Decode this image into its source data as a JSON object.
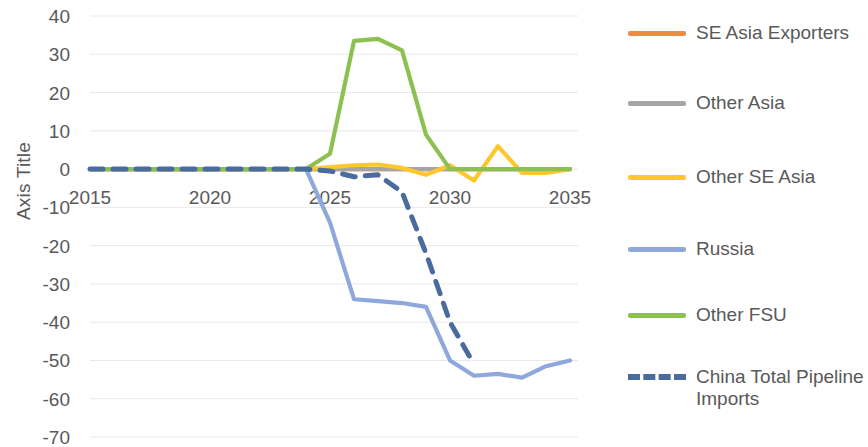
{
  "chart_data": {
    "type": "line",
    "title": "",
    "subtitle": "",
    "xlabel": "",
    "ylabel": "Axis Title",
    "xlim": [
      2015,
      2035
    ],
    "ylim": [
      -70,
      40
    ],
    "ytick_step": 10,
    "grid": true,
    "grid_axis": "y",
    "legend_position": "right",
    "x": [
      2015,
      2016,
      2017,
      2018,
      2019,
      2020,
      2021,
      2022,
      2023,
      2024,
      2025,
      2026,
      2027,
      2028,
      2029,
      2030,
      2031,
      2032,
      2033,
      2034,
      2035
    ],
    "xtick_labels": [
      "2015",
      "2020",
      "2025",
      "2030",
      "2035"
    ],
    "xticks": [
      2015,
      2020,
      2025,
      2030,
      2035
    ],
    "ytick_labels": [
      "40",
      "30",
      "20",
      "10",
      "0",
      "-10",
      "-20",
      "-30",
      "-40",
      "-50",
      "-60",
      "-70"
    ],
    "yticks": [
      40,
      30,
      20,
      10,
      0,
      -10,
      -20,
      -30,
      -40,
      -50,
      -60,
      -70
    ],
    "series": [
      {
        "name": "SE Asia Exporters",
        "color": "#ED8B45",
        "style": "solid",
        "values": [
          0,
          0,
          0,
          0,
          0,
          0,
          0,
          0,
          0,
          0,
          0,
          0,
          0,
          0,
          0,
          0,
          0,
          0,
          0,
          0,
          0
        ]
      },
      {
        "name": "Other Asia",
        "color": "#A5A5A5",
        "style": "solid",
        "values": [
          0,
          0,
          0,
          0,
          0,
          0,
          0,
          0,
          0,
          0,
          0,
          0,
          0,
          0,
          0,
          0,
          0,
          0,
          0,
          0,
          0
        ]
      },
      {
        "name": "Other SE Asia",
        "color": "#FFC72C",
        "style": "solid",
        "values": [
          0,
          0,
          0,
          0,
          0,
          0,
          0,
          0,
          0,
          0,
          0.5,
          1,
          1.2,
          0.3,
          -1.5,
          1,
          -3,
          6,
          -1,
          -1,
          0
        ]
      },
      {
        "name": "Russia",
        "color": "#8FA8DC",
        "style": "solid",
        "values": [
          0,
          0,
          0,
          0,
          0,
          0,
          0,
          0,
          0,
          0,
          -14,
          -34,
          -34.5,
          -35,
          -36,
          -50,
          -54,
          -53.5,
          -54.5,
          -51.5,
          -50
        ]
      },
      {
        "name": "Other FSU",
        "color": "#8CC152",
        "style": "solid",
        "values": [
          0,
          0,
          0,
          0,
          0,
          0,
          0,
          0,
          0,
          0,
          4,
          33.5,
          34,
          31,
          9,
          0,
          0,
          0,
          0,
          0,
          0
        ]
      },
      {
        "name": "China Total Pipeline Imports",
        "color": "#4A6B9E",
        "style": "dashed",
        "values": [
          0,
          0,
          0,
          0,
          0,
          0,
          0,
          0,
          0,
          0,
          -0.5,
          -2,
          -1.5,
          -6,
          -22,
          -40,
          -51,
          null,
          null,
          null,
          null
        ]
      }
    ]
  },
  "legend": {
    "items": [
      {
        "label": "SE Asia Exporters",
        "color": "#ED8B45",
        "style": "solid"
      },
      {
        "label": "Other Asia",
        "color": "#A5A5A5",
        "style": "solid"
      },
      {
        "label": "Other SE Asia",
        "color": "#FFC72C",
        "style": "solid"
      },
      {
        "label": "Russia",
        "color": "#8FA8DC",
        "style": "solid"
      },
      {
        "label": "Other FSU",
        "color": "#8CC152",
        "style": "solid"
      },
      {
        "label": "China Total Pipeline Imports",
        "color": "#4A6B9E",
        "style": "dashed"
      }
    ]
  },
  "axis": {
    "y_title": "Axis Title"
  }
}
